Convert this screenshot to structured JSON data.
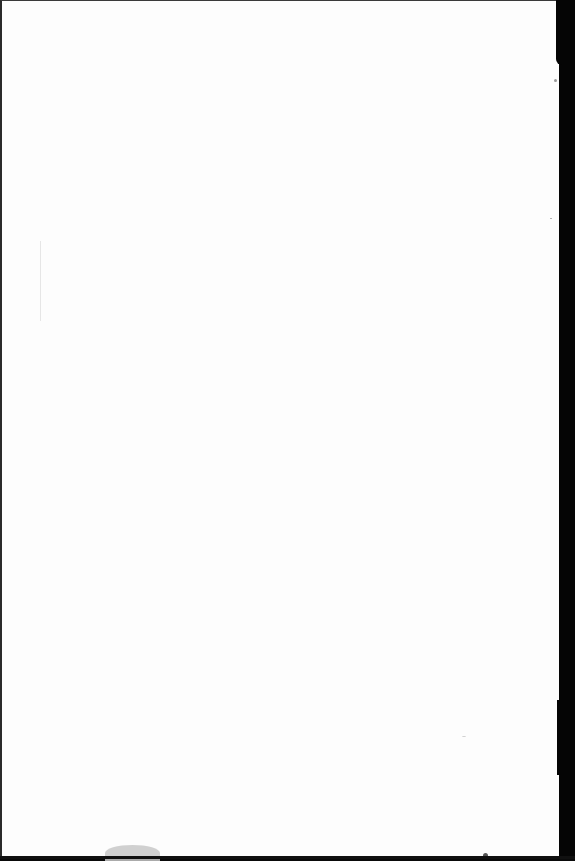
{
  "document": {
    "type": "scanned blank page",
    "visible_text": "",
    "bleed_through_text": [
      "",
      "",
      ""
    ],
    "colors": {
      "paper": "#fdfdfd",
      "scan_border": "#0a0a0a",
      "bleed_through": "#d6d6d6",
      "smudge": "#c8c8c8"
    }
  }
}
